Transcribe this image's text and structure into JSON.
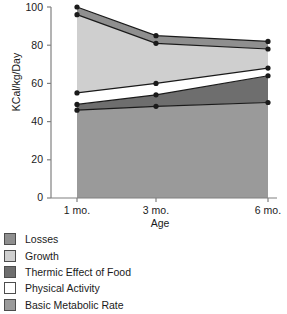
{
  "chart_data": {
    "type": "area",
    "stacked": true,
    "title": "",
    "xlabel": "Age",
    "ylabel": "KCal/kg/Day",
    "categories": [
      "1 mo.",
      "3 mo.",
      "6 mo."
    ],
    "x_values": [
      1,
      3,
      6
    ],
    "ylim": [
      0,
      100
    ],
    "yticks": [
      0,
      20,
      40,
      60,
      80,
      100
    ],
    "xticks": [
      "1 mo.",
      "3 mo.",
      "6 mo."
    ],
    "grid": false,
    "legend_position": "below",
    "series": [
      {
        "name": "Basic Metabolic Rate",
        "values": [
          46,
          48,
          50
        ],
        "cumulative": [
          46,
          48,
          50
        ],
        "color": "#9a9a9a"
      },
      {
        "name": "Thermic Effect of Food",
        "values": [
          3,
          6,
          14
        ],
        "cumulative": [
          49,
          54,
          64
        ],
        "color": "#6e6e6e"
      },
      {
        "name": "Physical Activity",
        "values": [
          6,
          6,
          4
        ],
        "cumulative": [
          55,
          60,
          68
        ],
        "color": "#ffffff"
      },
      {
        "name": "Growth",
        "values": [
          41,
          21,
          10
        ],
        "cumulative": [
          96,
          81,
          78
        ],
        "color": "#cfcfcf"
      },
      {
        "name": "Losses",
        "values": [
          4,
          4,
          4
        ],
        "cumulative": [
          100,
          85,
          82
        ],
        "color": "#8f8f8f"
      }
    ],
    "marker_color": "#1a1a1a",
    "line_color": "#1a1a1a"
  },
  "axis": {
    "y_label": "KCal/kg/Day",
    "x_label": "Age",
    "y_tick_100": "100",
    "y_tick_80": "80",
    "y_tick_60": "60",
    "y_tick_40": "40",
    "y_tick_20": "20",
    "y_tick_0": "0",
    "x_tick_1": "1 mo.",
    "x_tick_3": "3 mo.",
    "x_tick_6": "6 mo."
  },
  "legend": {
    "items": [
      {
        "label": "Losses",
        "color": "#8f8f8f"
      },
      {
        "label": "Growth",
        "color": "#cfcfcf"
      },
      {
        "label": "Thermic Effect of Food",
        "color": "#6e6e6e"
      },
      {
        "label": "Physical Activity",
        "color": "#ffffff"
      },
      {
        "label": "Basic Metabolic Rate",
        "color": "#9a9a9a"
      }
    ]
  }
}
